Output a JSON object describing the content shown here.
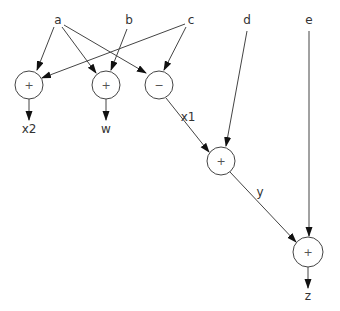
{
  "diagram": {
    "title": "",
    "inputs": [
      {
        "id": "a",
        "label": "a",
        "x": 58,
        "y": 20
      },
      {
        "id": "b",
        "label": "b",
        "x": 129,
        "y": 20
      },
      {
        "id": "c",
        "label": "c",
        "x": 191,
        "y": 20
      },
      {
        "id": "d",
        "label": "d",
        "x": 247,
        "y": 20
      },
      {
        "id": "e",
        "label": "e",
        "x": 309,
        "y": 20
      }
    ],
    "operators": [
      {
        "id": "op_x2",
        "symbol": "+",
        "cx": 29,
        "cy": 85,
        "r": 14
      },
      {
        "id": "op_w",
        "symbol": "+",
        "cx": 106,
        "cy": 85,
        "r": 14
      },
      {
        "id": "op_x1",
        "symbol": "−",
        "cx": 159,
        "cy": 85,
        "r": 14
      },
      {
        "id": "op_y",
        "symbol": "+",
        "cx": 221,
        "cy": 161,
        "r": 14
      },
      {
        "id": "op_z",
        "symbol": "+",
        "cx": 308,
        "cy": 252,
        "r": 15
      }
    ],
    "outputs": [
      {
        "id": "x2",
        "label": "x2",
        "x": 29,
        "y": 133
      },
      {
        "id": "w",
        "label": "w",
        "x": 106,
        "y": 133
      },
      {
        "id": "z",
        "label": "z",
        "x": 308,
        "y": 300
      }
    ],
    "edge_labels": [
      {
        "id": "x1",
        "label": "x1",
        "x": 188,
        "y": 121
      },
      {
        "id": "y",
        "label": "y",
        "x": 260,
        "y": 196
      }
    ],
    "edges": [
      {
        "from": "a",
        "to": "op_x2"
      },
      {
        "from": "a",
        "to": "op_w"
      },
      {
        "from": "a",
        "to": "op_x1"
      },
      {
        "from": "b",
        "to": "op_w"
      },
      {
        "from": "c",
        "to": "op_x2"
      },
      {
        "from": "c",
        "to": "op_x1"
      },
      {
        "from": "op_x1",
        "to": "op_y",
        "label": "x1"
      },
      {
        "from": "d",
        "to": "op_y"
      },
      {
        "from": "op_y",
        "to": "op_z",
        "label": "y"
      },
      {
        "from": "e",
        "to": "op_z"
      },
      {
        "from": "op_x2",
        "to": "x2"
      },
      {
        "from": "op_w",
        "to": "w"
      },
      {
        "from": "op_z",
        "to": "z"
      }
    ]
  }
}
